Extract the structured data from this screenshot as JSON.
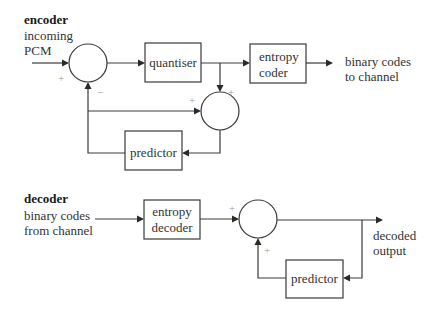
{
  "encoder": {
    "title": "encoder",
    "input_label": [
      "incoming",
      "PCM"
    ],
    "quantiser": "quantiser",
    "entropy_coder": [
      "entropy",
      "coder"
    ],
    "output_label": [
      "binary codes",
      "to channel"
    ],
    "predictor": "predictor",
    "signs": {
      "sum1_input": "+",
      "sum1_feedback": "−",
      "sum2_left": "+",
      "sum2_top": "+"
    }
  },
  "decoder": {
    "title": "decoder",
    "input_label": [
      "binary codes",
      "from channel"
    ],
    "entropy_decoder": [
      "entropy",
      "decoder"
    ],
    "output_label": [
      "decoded",
      "output"
    ],
    "predictor": "predictor",
    "signs": {
      "sum_left": "+",
      "sum_bottom": "+"
    }
  },
  "colors": {
    "line": "#3a3a3a",
    "text": "#333333",
    "sign": "#9a9a9a"
  }
}
